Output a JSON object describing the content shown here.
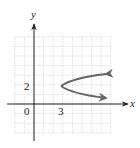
{
  "chart_data": {
    "type": "line",
    "title": "",
    "xlabel": "x",
    "ylabel": "y",
    "origin_label": "0",
    "x_tick_labels": [
      {
        "value": 3,
        "label": "3"
      }
    ],
    "y_tick_labels": [
      {
        "value": 2,
        "label": "2"
      }
    ],
    "xlim": [
      -2,
      8
    ],
    "ylim": [
      -3,
      7
    ],
    "grid": true,
    "grid_step": 1,
    "series": [
      {
        "name": "parabola opening right",
        "description": "Horizontal parabola with vertex at (3, 2), opening to the right, arrows on both ends",
        "vertex": [
          3,
          2
        ],
        "points": [
          [
            7.6,
            3.3
          ],
          [
            5,
            2.9
          ],
          [
            3,
            2
          ],
          [
            5,
            1.1
          ],
          [
            7.6,
            0.7
          ]
        ],
        "color": "#666666"
      }
    ]
  }
}
